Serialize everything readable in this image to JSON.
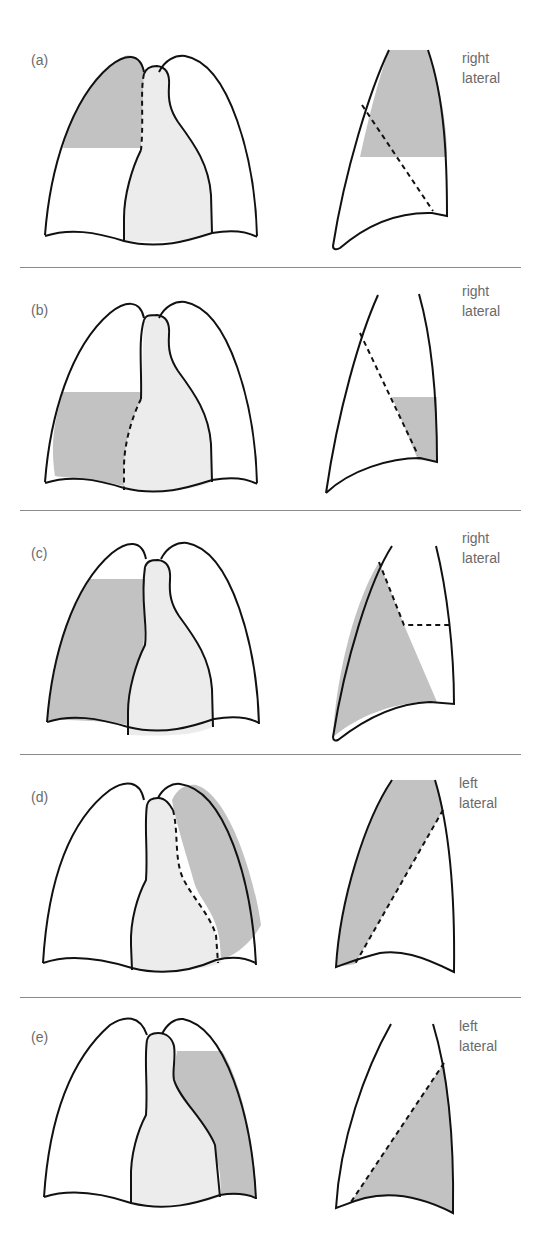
{
  "figure": {
    "colors": {
      "shaded": "#c2c2c2",
      "mediastinum": "#ececec",
      "outline": "#111111",
      "divider": "#8a8a8a",
      "label": "#6a6a6a"
    },
    "panels": [
      {
        "label": "(a)",
        "view_line1": "right",
        "view_line2": "lateral"
      },
      {
        "label": "(b)",
        "view_line1": "right",
        "view_line2": "lateral"
      },
      {
        "label": "(c)",
        "view_line1": "right",
        "view_line2": "lateral"
      },
      {
        "label": "(d)",
        "view_line1": "left",
        "view_line2": "lateral"
      },
      {
        "label": "(e)",
        "view_line1": "left",
        "view_line2": "lateral"
      }
    ]
  }
}
